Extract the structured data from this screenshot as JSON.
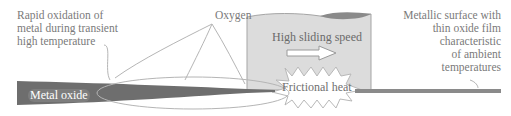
{
  "diagram": {
    "labels": {
      "rapid_oxidation": [
        "Rapid oxidation of",
        "metal during transient",
        "high temperature"
      ],
      "oxygen": "Oxygen",
      "metallic_surface": [
        "Metallic surface with",
        "thin oxide film",
        "characteristic",
        "of ambient",
        "temperatures"
      ],
      "high_sliding_speed": "High sliding speed",
      "frictional_heat": "Frictional heat",
      "metal_oxide": "Metal oxide"
    },
    "colors": {
      "oxide_wedge": "#6e6e6e",
      "slider_fill": "#d9d9d9",
      "slider_outline": "#9a9a9a",
      "thin_film": "#8a8a8a",
      "leader_lines": "#b0b0b0",
      "text": "#7a7a7a"
    }
  }
}
